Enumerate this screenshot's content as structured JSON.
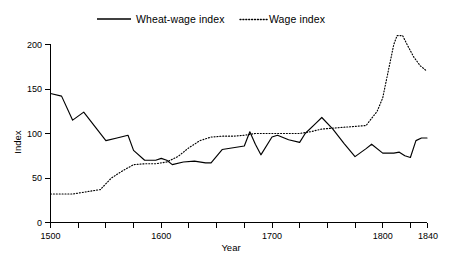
{
  "chart_data": {
    "type": "line",
    "title": "",
    "xlabel": "Year",
    "ylabel": "Index",
    "xlim": [
      1500,
      1840
    ],
    "ylim": [
      0,
      200
    ],
    "grid": false,
    "legend_position": "top",
    "x_major_ticks": [
      1500,
      1600,
      1700,
      1800,
      1840
    ],
    "x_major_tick_labels": [
      "1500",
      "1600",
      "1700",
      "1800",
      "1840"
    ],
    "x_minor_tick_step": 25,
    "y_ticks": [
      0,
      50,
      100,
      150,
      200
    ],
    "y_tick_labels": [
      "0",
      "50",
      "100",
      "150",
      "200"
    ],
    "series": [
      {
        "name": "Wheat-wage index",
        "style": "solid",
        "color": "#000000",
        "x": [
          1500,
          1510,
          1520,
          1530,
          1540,
          1550,
          1560,
          1570,
          1575,
          1585,
          1595,
          1600,
          1605,
          1610,
          1620,
          1630,
          1640,
          1645,
          1655,
          1665,
          1675,
          1680,
          1685,
          1690,
          1700,
          1705,
          1715,
          1725,
          1730,
          1740,
          1745,
          1755,
          1765,
          1775,
          1785,
          1790,
          1800,
          1810,
          1815,
          1820,
          1825,
          1830,
          1835,
          1840
        ],
        "values": [
          145,
          142,
          115,
          124,
          108,
          92,
          95,
          98,
          81,
          70,
          70,
          72,
          70,
          65,
          68,
          69,
          67,
          67,
          82,
          84,
          86,
          102,
          88,
          76,
          96,
          98,
          93,
          90,
          100,
          112,
          118,
          105,
          89,
          74,
          83,
          88,
          78,
          78,
          79,
          75,
          73,
          92,
          95,
          95
        ]
      },
      {
        "name": "Wage index",
        "style": "dotted",
        "color": "#000000",
        "x": [
          1500,
          1520,
          1535,
          1545,
          1555,
          1565,
          1575,
          1585,
          1595,
          1605,
          1615,
          1625,
          1635,
          1645,
          1655,
          1665,
          1675,
          1685,
          1695,
          1710,
          1725,
          1735,
          1745,
          1755,
          1765,
          1775,
          1785,
          1795,
          1800,
          1805,
          1810,
          1813,
          1818,
          1822,
          1828,
          1834,
          1840
        ],
        "values": [
          32,
          32,
          35,
          37,
          50,
          58,
          65,
          66,
          66,
          68,
          74,
          84,
          92,
          96,
          97,
          97,
          98,
          100,
          100,
          100,
          100,
          102,
          105,
          106,
          107,
          108,
          109,
          125,
          140,
          170,
          200,
          210,
          210,
          200,
          186,
          176,
          170
        ]
      }
    ]
  },
  "legend": {
    "entries": [
      {
        "label": "Wheat-wage index",
        "style": "solid"
      },
      {
        "label": "Wage index",
        "style": "dotted"
      }
    ]
  },
  "axes": {
    "y_title": "Index",
    "x_title": "Year"
  }
}
